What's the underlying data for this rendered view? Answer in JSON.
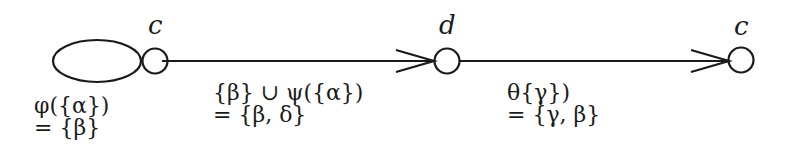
{
  "diagram": {
    "type": "automaton / transition diagram",
    "colors": {
      "stroke": "#1a1a1a",
      "background": "#ffffff"
    },
    "nodes": [
      {
        "id": "start",
        "shape": "ellipse",
        "label": ""
      },
      {
        "id": "n1",
        "shape": "circle",
        "label": "c"
      },
      {
        "id": "n2",
        "shape": "circle",
        "label": "d"
      },
      {
        "id": "n3",
        "shape": "circle",
        "label": "c"
      }
    ],
    "edges": [
      {
        "from": "n1",
        "to": "n2",
        "arrow": true
      },
      {
        "from": "n2",
        "to": "n3",
        "arrow": true
      }
    ],
    "annotations": {
      "start": {
        "line1": "φ({α})",
        "line2": "= {β}"
      },
      "edge1": {
        "line1": "{β} ∪ ψ({α})",
        "line2": "= {β, δ}"
      },
      "edge2": {
        "line1": "θ{γ})",
        "line2": "= {γ, β}"
      }
    }
  }
}
